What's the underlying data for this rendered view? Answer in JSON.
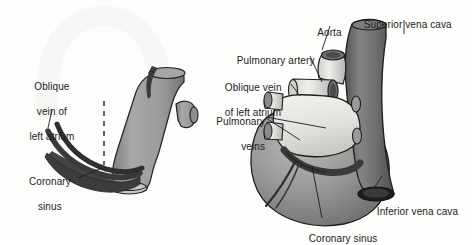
{
  "figure": {
    "background_color": "#fdfdfc",
    "panels": [
      {
        "name": "schematic-coronary-sinus",
        "side": "left"
      },
      {
        "name": "posterior-heart-view",
        "side": "right"
      }
    ]
  },
  "colors": {
    "ink": "#1c1c1c",
    "vein_dark": "#3a3a3a",
    "sinus_dark": "#444444",
    "vessel_gray": "#9c9c9c",
    "vessel_gray_dark": "#6b6b6b",
    "cava_gray": "#6e6e6e",
    "heart_gray": "#8d8d8d",
    "atrium_light": "#e8e8e6",
    "ghost": "#f4f4f2"
  },
  "labels": {
    "left_panel": [
      {
        "id": "oblique-vein-left",
        "lines": [
          "Oblique",
          "vein of",
          "left atrium"
        ],
        "x": 14,
        "y": 68,
        "width": 70,
        "align": "center"
      },
      {
        "id": "coronary-sinus-left",
        "lines": [
          "Coronary",
          "sinus"
        ],
        "x": 16,
        "y": 163,
        "width": 62,
        "align": "center"
      }
    ],
    "right_panel": [
      {
        "id": "aorta",
        "lines": [
          "Aorta"
        ],
        "x": 312,
        "y": 14,
        "width": 36,
        "align": "left"
      },
      {
        "id": "superior-vena-cava",
        "lines": [
          "Superior vena cava"
        ],
        "x": 358,
        "y": 6,
        "width": 110,
        "align": "left"
      },
      {
        "id": "pulmonary-artery",
        "lines": [
          "Pulmonary artery"
        ],
        "x": 231,
        "y": 42,
        "width": 95,
        "align": "left"
      },
      {
        "id": "oblique-vein-right",
        "lines": [
          "Oblique vein",
          "of left atrium"
        ],
        "x": 219,
        "y": 69,
        "width": 78,
        "align": "left"
      },
      {
        "id": "pulmonary-veins",
        "lines": [
          "Pulmonary",
          "veins"
        ],
        "x": 207,
        "y": 103,
        "width": 60,
        "align": "right"
      },
      {
        "id": "inferior-vena-cava",
        "lines": [
          "Inferior vena cava"
        ],
        "x": 371,
        "y": 193,
        "width": 100,
        "align": "left"
      },
      {
        "id": "coronary-sinus-right",
        "lines": [
          "Coronary sinus"
        ],
        "x": 303,
        "y": 220,
        "width": 86,
        "align": "left"
      }
    ]
  },
  "anatomy_parts": [
    "oblique vein of left atrium",
    "coronary sinus",
    "great cardiac vein",
    "aorta",
    "pulmonary artery",
    "pulmonary veins",
    "superior vena cava",
    "inferior vena cava",
    "left atrium",
    "left ventricle"
  ]
}
